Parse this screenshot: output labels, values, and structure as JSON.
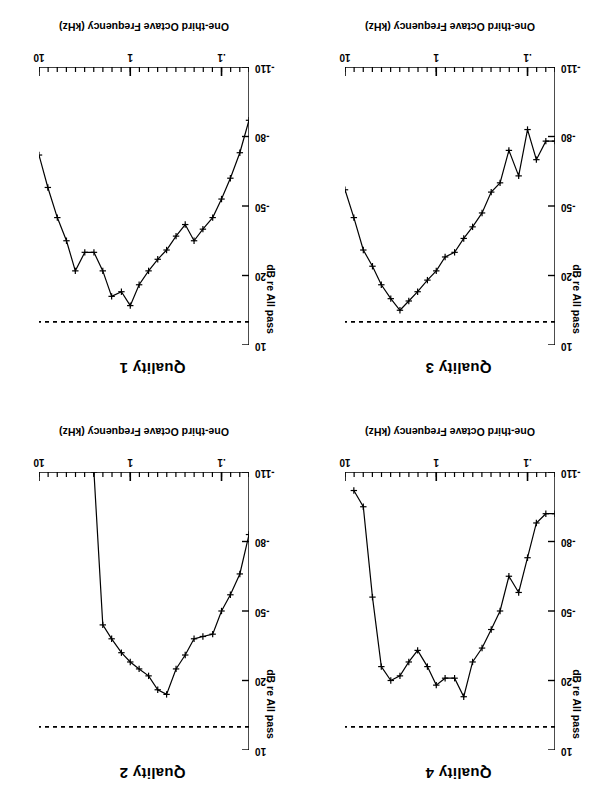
{
  "figure": {
    "orientation": "rotated-180",
    "panel_count": 4,
    "ylabel": "dB re All pass",
    "xlabel": "One-third Octave Frequency (kHz)",
    "ytick_labels": [
      "10",
      "-20",
      "-50",
      "-80",
      "-110"
    ],
    "xtick_labels": [
      ".1",
      "1",
      "10"
    ],
    "line_color": "#000000",
    "reference_line_color": "#000000",
    "background_color": "#ffffff"
  },
  "panels": [
    {
      "id": "quality-1",
      "title": "Quality 1"
    },
    {
      "id": "quality-2",
      "title": "Quality 2"
    },
    {
      "id": "quality-3",
      "title": "Quality 3"
    },
    {
      "id": "quality-4",
      "title": "Quality 4"
    }
  ],
  "chart_data": [
    {
      "type": "line",
      "title": "Quality 1",
      "xlabel": "One-third Octave Frequency (kHz)",
      "ylabel": "dB re All pass",
      "xscale": "log",
      "xlim": [
        0.05,
        10.0
      ],
      "ylim": [
        -110,
        10
      ],
      "yticks": [
        10,
        -20,
        -50,
        -80,
        -110
      ],
      "xticks": [
        0.1,
        1,
        10
      ],
      "grid": false,
      "legend": null,
      "marker": "plus",
      "reference_line": {
        "value": 0,
        "style": "dashed",
        "label": "All pass"
      },
      "x": [
        0.05,
        0.063,
        0.08,
        0.1,
        0.125,
        0.16,
        0.2,
        0.25,
        0.315,
        0.4,
        0.5,
        0.63,
        0.8,
        1.0,
        1.25,
        1.6,
        2.0,
        2.5,
        3.15,
        4.0,
        5.0,
        6.3,
        8.0,
        10.0
      ],
      "y": [
        -87,
        -73,
        -62,
        -53,
        -45,
        -40,
        -35,
        -42,
        -37,
        -31,
        -27,
        -22,
        -16,
        -7,
        -13,
        -11,
        -22,
        -30,
        -30,
        -22,
        -35,
        -45,
        -58,
        -72,
        -83
      ]
    },
    {
      "type": "line",
      "title": "Quality 2",
      "xlabel": "One-third Octave Frequency (kHz)",
      "ylabel": "dB re All pass",
      "xscale": "log",
      "xlim": [
        0.05,
        10.0
      ],
      "ylim": [
        -110,
        10
      ],
      "yticks": [
        10,
        -20,
        -50,
        -80,
        -110
      ],
      "xticks": [
        0.1,
        1,
        10
      ],
      "grid": false,
      "legend": null,
      "marker": "plus",
      "reference_line": {
        "value": 0,
        "style": "dashed",
        "label": "All pass"
      },
      "x": [
        0.05,
        0.063,
        0.08,
        0.1,
        0.125,
        0.16,
        0.2,
        0.25,
        0.315,
        0.4,
        0.5,
        0.63,
        0.8,
        1.0,
        1.25,
        1.6,
        2.0,
        2.5
      ],
      "y": [
        -83,
        -66,
        -57,
        -50,
        -40,
        -39,
        -38,
        -31,
        -25,
        -14,
        -16,
        -22,
        -25,
        -28,
        -32,
        -38,
        -44,
        -110
      ]
    },
    {
      "type": "line",
      "title": "Quality 3",
      "xlabel": "One-third Octave Frequency (kHz)",
      "ylabel": "dB re All pass",
      "xscale": "log",
      "xlim": [
        0.05,
        10.0
      ],
      "ylim": [
        -110,
        10
      ],
      "yticks": [
        10,
        -20,
        -50,
        -80,
        -110
      ],
      "xticks": [
        0.1,
        1,
        10
      ],
      "grid": false,
      "legend": null,
      "marker": "plus",
      "reference_line": {
        "value": 0,
        "style": "dashed",
        "label": "All pass"
      },
      "x": [
        0.05,
        0.063,
        0.08,
        0.1,
        0.125,
        0.16,
        0.2,
        0.25,
        0.315,
        0.4,
        0.5,
        0.63,
        0.8,
        1.0,
        1.25,
        1.6,
        2.0,
        2.5,
        3.15,
        4.0,
        5.0,
        6.3,
        8.0,
        10.0
      ],
      "y": [
        -78,
        -78,
        -70,
        -83,
        -63,
        -74,
        -60,
        -56,
        -47,
        -41,
        -36,
        -30,
        -28,
        -22,
        -18,
        -13,
        -9,
        -5,
        -10,
        -16,
        -24,
        -31,
        -45,
        -57
      ]
    },
    {
      "type": "line",
      "title": "Quality 4",
      "xlabel": "One-third Octave Frequency (kHz)",
      "ylabel": "dB re All pass",
      "xscale": "log",
      "xlim": [
        0.05,
        10.0
      ],
      "ylim": [
        -110,
        10
      ],
      "yticks": [
        10,
        -20,
        -50,
        -80,
        -110
      ],
      "xticks": [
        0.1,
        1,
        10
      ],
      "grid": false,
      "legend": null,
      "marker": "plus",
      "reference_line": {
        "value": 0,
        "style": "dashed",
        "label": "All pass"
      },
      "x": [
        0.05,
        0.063,
        0.08,
        0.1,
        0.125,
        0.16,
        0.2,
        0.25,
        0.315,
        0.4,
        0.5,
        0.63,
        0.8,
        1.0,
        1.25,
        1.6,
        2.0,
        2.5,
        3.15,
        4.0,
        5.0,
        6.3,
        8.0
      ],
      "y": [
        -92,
        -92,
        -88,
        -73,
        -58,
        -65,
        -50,
        -42,
        -34,
        -28,
        -13,
        -21,
        -21,
        -18,
        -26,
        -33,
        -28,
        -22,
        -20,
        -26,
        -56,
        -95,
        -102
      ]
    }
  ]
}
